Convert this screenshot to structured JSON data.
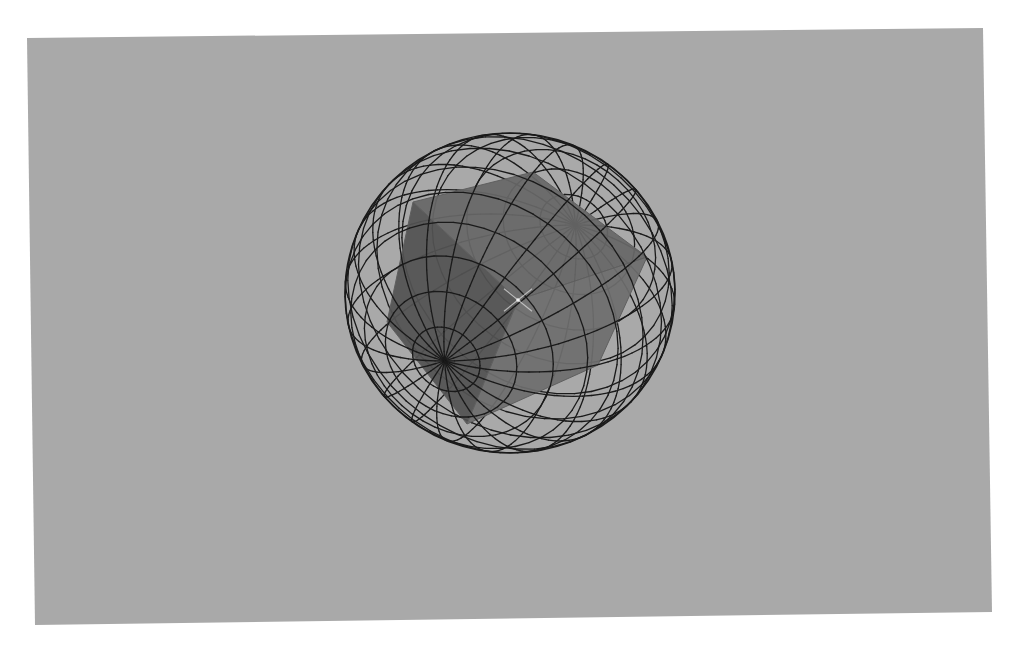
{
  "canvas": {
    "page_color": "#ffffff",
    "viewport_color": "#a9a9a9",
    "viewport_corners": [
      [
        27,
        38
      ],
      [
        983,
        28
      ],
      [
        992,
        612
      ],
      [
        35,
        625
      ]
    ]
  },
  "scene": {
    "description": "Rendered shaded cube enclosed in a wireframe sphere",
    "sphere": {
      "center": [
        510,
        293
      ],
      "radius_x": 165,
      "radius_y": 160,
      "line_color": "#1a1a1a",
      "line_width": 1.3,
      "latitude_count": 14,
      "longitude_count": 22,
      "axis_tilt_deg": -43,
      "axis_lean": 0.62,
      "pole_front": [
        620,
        395
      ],
      "pole_back": [
        405,
        195
      ]
    },
    "cube": {
      "faces": [
        {
          "name": "left-face",
          "color": "#535353",
          "points": [
            [
              413,
              202
            ],
            [
              387,
              322
            ],
            [
              467,
              424
            ],
            [
              518,
              300
            ]
          ]
        },
        {
          "name": "top-face",
          "color": "#676767",
          "points": [
            [
              413,
              202
            ],
            [
              533,
              172
            ],
            [
              647,
              257
            ],
            [
              518,
              300
            ]
          ]
        },
        {
          "name": "front-face",
          "color": "#6e6e6e",
          "points": [
            [
              518,
              300
            ],
            [
              647,
              257
            ],
            [
              598,
              365
            ],
            [
              467,
              424
            ]
          ]
        }
      ],
      "edge_soft_color": "#5f5f5f",
      "highlight": {
        "center": [
          518,
          300
        ],
        "size": 14,
        "color": "#d8d8d8"
      }
    }
  }
}
